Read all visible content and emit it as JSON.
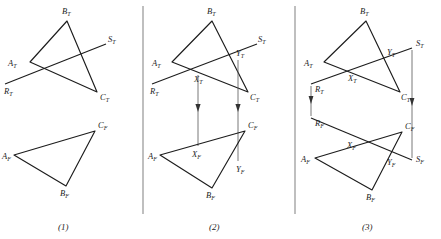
{
  "figure": {
    "title": "",
    "background_color": "#ffffff",
    "ink_color": "#1c1c1c",
    "divider_color": "#8a8a8a",
    "panel_count": 3
  },
  "captions": [
    {
      "text": "(1)",
      "x": 65,
      "y": 229
    },
    {
      "text": "(2)",
      "x": 216,
      "y": 229
    },
    {
      "text": "(3)",
      "x": 369,
      "y": 229
    }
  ],
  "dividers": [
    {
      "x": 143,
      "y1": 6,
      "y2": 214
    },
    {
      "x": 295,
      "y1": 6,
      "y2": 214
    }
  ],
  "panels": [
    {
      "id": "panel-1",
      "caption": "(1)",
      "top_view": {
        "triangle": {
          "A": [
            30,
            62
          ],
          "B": [
            67,
            21
          ],
          "C": [
            97,
            92
          ]
        },
        "line_RS": {
          "R": [
            5,
            84
          ],
          "S": [
            106,
            44
          ]
        },
        "labels": [
          {
            "base": "A",
            "sub": "T",
            "x": 8,
            "y": 66
          },
          {
            "base": "B",
            "sub": "T",
            "x": 62,
            "y": 14
          },
          {
            "base": "C",
            "sub": "T",
            "x": 100,
            "y": 100
          },
          {
            "base": "R",
            "sub": "T",
            "x": 4,
            "y": 94
          },
          {
            "base": "S",
            "sub": "T",
            "x": 108,
            "y": 42
          }
        ]
      },
      "front_view": {
        "triangle": {
          "A": [
            14,
            155
          ],
          "B": [
            66,
            186
          ],
          "C": [
            95,
            131
          ]
        },
        "labels": [
          {
            "base": "A",
            "sub": "F",
            "x": 2,
            "y": 159
          },
          {
            "base": "B",
            "sub": "F",
            "x": 60,
            "y": 196
          },
          {
            "base": "C",
            "sub": "F",
            "x": 98,
            "y": 128
          }
        ]
      }
    },
    {
      "id": "panel-2",
      "caption": "(2)",
      "top_view": {
        "triangle": {
          "A": [
            172,
            62
          ],
          "B": [
            212,
            21
          ],
          "C": [
            248,
            92
          ]
        },
        "line_RS": {
          "R": [
            152,
            84
          ],
          "S": [
            257,
            44
          ]
        },
        "pierce_points": [
          {
            "name": "X",
            "sub": "T",
            "x": 198,
            "y": 73
          },
          {
            "name": "Y",
            "sub": "T",
            "x": 238,
            "y": 58
          }
        ],
        "labels": [
          {
            "base": "A",
            "sub": "T",
            "x": 152,
            "y": 66
          },
          {
            "base": "B",
            "sub": "T",
            "x": 207,
            "y": 14
          },
          {
            "base": "C",
            "sub": "T",
            "x": 250,
            "y": 100
          },
          {
            "base": "R",
            "sub": "T",
            "x": 150,
            "y": 94
          },
          {
            "base": "S",
            "sub": "T",
            "x": 258,
            "y": 42
          },
          {
            "base": "X",
            "sub": "T",
            "x": 194,
            "y": 82
          },
          {
            "base": "Y",
            "sub": "T",
            "x": 236,
            "y": 56
          }
        ]
      },
      "front_view": {
        "triangle": {
          "A": [
            160,
            155
          ],
          "B": [
            212,
            188
          ],
          "C": [
            245,
            131
          ]
        },
        "pierce_points": [
          {
            "name": "X",
            "sub": "F",
            "x": 198,
            "y": 148
          },
          {
            "name": "Y",
            "sub": "F",
            "x": 238,
            "y": 163
          }
        ],
        "labels": [
          {
            "base": "A",
            "sub": "F",
            "x": 148,
            "y": 159
          },
          {
            "base": "B",
            "sub": "F",
            "x": 206,
            "y": 198
          },
          {
            "base": "C",
            "sub": "F",
            "x": 248,
            "y": 128
          },
          {
            "base": "X",
            "sub": "F",
            "x": 192,
            "y": 157
          },
          {
            "base": "Y",
            "sub": "F",
            "x": 236,
            "y": 172
          }
        ]
      },
      "projectors": [
        {
          "from": "X",
          "x": 198,
          "y1": 75,
          "y2": 146,
          "arrow_y": 110
        },
        {
          "from": "Y",
          "x": 238,
          "y1": 60,
          "y2": 161,
          "arrow_y": 110
        }
      ]
    },
    {
      "id": "panel-3",
      "caption": "(3)",
      "top_view": {
        "triangle": {
          "A": [
            324,
            62
          ],
          "B": [
            366,
            21
          ],
          "C": [
            400,
            92
          ]
        },
        "line_RS": {
          "R": [
            311,
            84
          ],
          "S": [
            412,
            48
          ]
        },
        "pierce_points": [
          {
            "name": "X",
            "sub": "T",
            "x": 352,
            "y": 72
          },
          {
            "name": "Y",
            "sub": "T",
            "x": 390,
            "y": 57
          }
        ],
        "labels": [
          {
            "base": "A",
            "sub": "T",
            "x": 304,
            "y": 66
          },
          {
            "base": "B",
            "sub": "T",
            "x": 360,
            "y": 14
          },
          {
            "base": "C",
            "sub": "T",
            "x": 401,
            "y": 100
          },
          {
            "base": "R",
            "sub": "T",
            "x": 315,
            "y": 92
          },
          {
            "base": "S",
            "sub": "T",
            "x": 416,
            "y": 46
          },
          {
            "base": "X",
            "sub": "T",
            "x": 348,
            "y": 81
          },
          {
            "base": "Y",
            "sub": "T",
            "x": 387,
            "y": 55
          }
        ]
      },
      "front_view": {
        "triangle": {
          "A": [
            315,
            158
          ],
          "B": [
            372,
            190
          ],
          "C": [
            402,
            132
          ]
        },
        "line_RS": {
          "R": [
            311,
            118
          ],
          "S": [
            412,
            160
          ]
        },
        "pierce_points": [
          {
            "name": "X",
            "sub": "F",
            "x": 352,
            "y": 139
          },
          {
            "name": "Y",
            "sub": "F",
            "x": 390,
            "y": 155
          }
        ],
        "labels": [
          {
            "base": "R",
            "sub": "F",
            "x": 315,
            "y": 126
          },
          {
            "base": "S",
            "sub": "F",
            "x": 416,
            "y": 162
          },
          {
            "base": "A",
            "sub": "F",
            "x": 301,
            "y": 162
          },
          {
            "base": "B",
            "sub": "F",
            "x": 366,
            "y": 200
          },
          {
            "base": "C",
            "sub": "F",
            "x": 405,
            "y": 129
          },
          {
            "base": "X",
            "sub": "F",
            "x": 347,
            "y": 148
          },
          {
            "base": "Y",
            "sub": "F",
            "x": 387,
            "y": 165
          }
        ]
      },
      "projectors": [
        {
          "from": "R",
          "x": 311,
          "y1": 86,
          "y2": 116,
          "arrow_y": 102
        },
        {
          "from": "S",
          "x": 412,
          "y1": 50,
          "y2": 158,
          "arrow_y": 104
        }
      ]
    }
  ]
}
